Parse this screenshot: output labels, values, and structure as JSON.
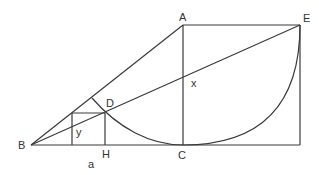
{
  "diagram": {
    "points": {
      "A": {
        "label": "A",
        "x": 183,
        "y": 25
      },
      "B": {
        "label": "B",
        "x": 31,
        "y": 145
      },
      "C": {
        "label": "C",
        "x": 183,
        "y": 145
      },
      "D": {
        "label": "D",
        "x": 105,
        "y": 113
      },
      "E": {
        "label": "E",
        "x": 300,
        "y": 25
      },
      "H": {
        "label": "H",
        "x": 105,
        "y": 145
      }
    },
    "labels": {
      "A": "A",
      "B": "B",
      "C": "C",
      "D": "D",
      "E": "E",
      "H": "H",
      "x": "x",
      "y": "y",
      "a": "a"
    },
    "colors": {
      "stroke": "#3a3a3a",
      "text": "#333333",
      "background": "#ffffff"
    }
  }
}
